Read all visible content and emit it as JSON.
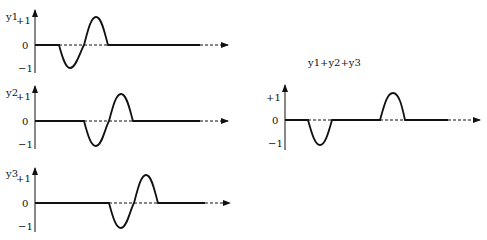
{
  "diagram": {
    "type": "wave-superposition",
    "panels": [
      {
        "id": "y1",
        "label": "y1",
        "ticks": {
          "pos": "+1",
          "zero": "0",
          "neg": "−1"
        },
        "origin": [
          35,
          45
        ],
        "pulse": {
          "start": 59,
          "end": 108,
          "first_extreme": "negative"
        }
      },
      {
        "id": "y2",
        "label": "y2",
        "ticks": {
          "pos": "+1",
          "zero": "0",
          "neg": "−1"
        },
        "origin": [
          35,
          121
        ],
        "pulse": {
          "start": 84,
          "end": 133,
          "first_extreme": "negative"
        }
      },
      {
        "id": "y3",
        "label": "y3",
        "ticks": {
          "pos": "+1",
          "zero": "0",
          "neg": "−1"
        },
        "origin": [
          35,
          203
        ],
        "pulse": {
          "start": 109,
          "end": 158,
          "first_extreme": "negative"
        }
      }
    ],
    "sum": {
      "title": "y1+y2+y3",
      "ticks": {
        "pos": "+1",
        "zero": "0",
        "neg": "−1"
      },
      "origin": [
        285,
        120
      ],
      "segments": [
        {
          "type": "dip",
          "start": 308,
          "end": 332
        },
        {
          "type": "bump",
          "start": 380,
          "end": 405
        }
      ]
    }
  }
}
